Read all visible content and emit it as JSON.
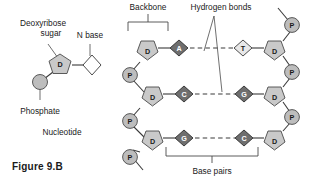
{
  "figure": {
    "caption": "Figure 9.B",
    "nucleotide_label": "Nucleotide",
    "labels": {
      "sugar_line1": "Deoxyribose",
      "sugar_line2": "sugar",
      "n_base": "N base",
      "phosphate": "Phosphate",
      "backbone": "Backbone",
      "hydrogen_bonds": "Hydrogen bonds",
      "base_pairs": "Base pairs"
    }
  },
  "glyphs": {
    "sugar": "D",
    "phosphate": "P"
  },
  "nucleotide_diagram": {
    "sugar_glyph": "D",
    "base_glyph": "",
    "phosphate_glyph": ""
  },
  "dna": {
    "rows": [
      {
        "left_sugar": "D",
        "left_base": "A",
        "left_base_shade": "dark",
        "right_base": "T",
        "right_base_shade": "light",
        "right_sugar": "D"
      },
      {
        "left_sugar": "D",
        "left_base": "C",
        "left_base_shade": "dark",
        "right_base": "G",
        "right_base_shade": "dark",
        "right_sugar": "D"
      },
      {
        "left_sugar": "D",
        "left_base": "G",
        "left_base_shade": "dark",
        "right_base": "C",
        "right_base_shade": "dark",
        "right_sugar": "D"
      }
    ],
    "left_phosphates": [
      "P",
      "P",
      "P"
    ],
    "right_phosphates": [
      "P",
      "P",
      "P"
    ]
  },
  "colors": {
    "sugar_fill": "#c9c9c9",
    "phosphate_fill": "#bdbdbd",
    "base_dark_fill": "#6e6e6e",
    "base_light_fill": "#e8e8e8",
    "stroke": "#3a3a3a",
    "text": "#1a1a1a",
    "background": "#ffffff"
  }
}
